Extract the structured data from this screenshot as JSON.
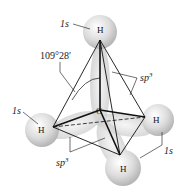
{
  "diagram": {
    "molecule": "CH4 tetrahedral structure",
    "atoms": {
      "center": "C",
      "top": "H",
      "left": "H",
      "right": "H",
      "bottom": "H"
    },
    "labels": {
      "top_orbital": "1s",
      "left_orbital": "1s",
      "right_orbital": "1s",
      "bond_angle": "109°28′",
      "hybrid_upper_base": "sp",
      "hybrid_upper_exp": "3",
      "hybrid_lower_base": "sp",
      "hybrid_lower_exp": "3"
    },
    "colors": {
      "orbital_fill": "#d9d9d9",
      "line": "#111111"
    }
  }
}
